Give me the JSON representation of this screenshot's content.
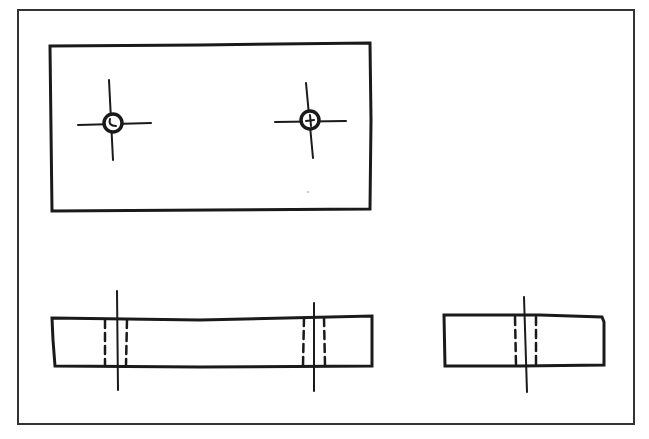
{
  "diagram": {
    "type": "orthographic-sketch",
    "colors": {
      "ink": "#1a1a1a",
      "paper": "#ffffff"
    },
    "frame": {
      "x": 18,
      "y": 10,
      "w": 616,
      "h": 414
    },
    "views": [
      {
        "name": "top-view",
        "rect": {
          "x": 50,
          "y": 44,
          "w": 320,
          "h": 166
        },
        "holes": [
          {
            "cx": 113,
            "cy": 122,
            "r": 9,
            "centerline_h": [
              78,
              151
            ],
            "centerline_v": [
              80,
              160
            ]
          },
          {
            "cx": 310,
            "cy": 120,
            "r": 9,
            "centerline_h": [
              275,
              346
            ],
            "centerline_v": [
              83,
              158
            ]
          }
        ]
      },
      {
        "name": "front-view",
        "rect": {
          "x": 52,
          "y": 318,
          "w": 320,
          "h": 47
        },
        "hidden_holes": [
          {
            "axis_x": 117,
            "left": 105,
            "right": 127,
            "axis_y": [
              291,
              390
            ]
          },
          {
            "axis_x": 314,
            "left": 303,
            "right": 325,
            "axis_y": [
              303,
              391
            ]
          }
        ]
      },
      {
        "name": "side-view",
        "rect": {
          "x": 444,
          "y": 315,
          "w": 160,
          "h": 51
        },
        "hidden_holes": [
          {
            "axis_x": 525,
            "left": 515,
            "right": 536,
            "axis_y": [
              297,
              392
            ]
          }
        ]
      }
    ]
  }
}
